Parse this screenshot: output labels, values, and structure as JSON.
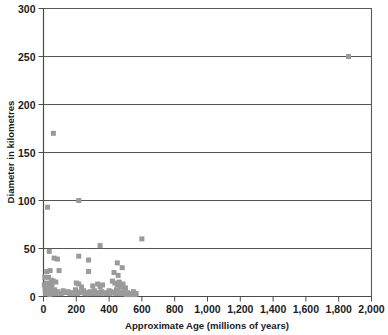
{
  "chart_data": {
    "type": "scatter",
    "title": "",
    "subtitle": "",
    "xlabel": "Approximate Age (millions of years)",
    "ylabel": "Diameter in kilometres",
    "xlim": [
      0,
      2000
    ],
    "ylim": [
      0,
      300
    ],
    "xticks": [
      0,
      200,
      400,
      600,
      800,
      1000,
      1200,
      1400,
      1600,
      1800,
      2000
    ],
    "xtick_labels": [
      "0",
      "200",
      "400",
      "600",
      "800",
      "1,000",
      "1,200",
      "1,400",
      "1,600",
      "1,800",
      "2,000"
    ],
    "yticks": [
      0,
      50,
      100,
      150,
      200,
      250,
      300
    ],
    "ytick_labels": [
      "0",
      "50",
      "100",
      "150",
      "200",
      "250",
      "300"
    ],
    "grid": "horizontal",
    "gridlines_y": [
      50,
      100,
      150,
      200,
      250
    ],
    "legend": "none",
    "marker": "square",
    "marker_color": "#9a9a9a",
    "marker_size_px": 5,
    "series": [
      {
        "name": "Impact craters",
        "points": [
          [
            1860,
            250
          ],
          [
            60,
            170
          ],
          [
            215,
            100
          ],
          [
            25,
            93
          ],
          [
            600,
            60
          ],
          [
            345,
            53
          ],
          [
            35,
            47
          ],
          [
            65,
            40
          ],
          [
            85,
            39
          ],
          [
            215,
            42
          ],
          [
            275,
            38
          ],
          [
            450,
            35
          ],
          [
            480,
            30
          ],
          [
            20,
            26
          ],
          [
            40,
            27
          ],
          [
            95,
            27
          ],
          [
            275,
            26
          ],
          [
            430,
            25
          ],
          [
            455,
            22
          ],
          [
            30,
            20
          ],
          [
            48,
            17
          ],
          [
            60,
            16
          ],
          [
            75,
            15
          ],
          [
            18,
            14
          ],
          [
            36,
            13
          ],
          [
            52,
            12
          ],
          [
            200,
            14
          ],
          [
            215,
            13
          ],
          [
            232,
            10
          ],
          [
            300,
            11
          ],
          [
            330,
            13
          ],
          [
            345,
            10
          ],
          [
            360,
            12
          ],
          [
            420,
            16
          ],
          [
            435,
            14
          ],
          [
            450,
            12
          ],
          [
            462,
            15
          ],
          [
            470,
            10
          ],
          [
            485,
            13
          ],
          [
            500,
            9
          ],
          [
            10,
            8
          ],
          [
            22,
            9
          ],
          [
            30,
            7
          ],
          [
            42,
            8
          ],
          [
            55,
            6
          ],
          [
            68,
            7
          ],
          [
            88,
            5
          ],
          [
            120,
            6
          ],
          [
            150,
            5
          ],
          [
            175,
            4
          ],
          [
            195,
            7
          ],
          [
            228,
            5
          ],
          [
            245,
            6
          ],
          [
            262,
            4
          ],
          [
            285,
            5
          ],
          [
            310,
            6
          ],
          [
            338,
            4
          ],
          [
            355,
            5
          ],
          [
            372,
            4
          ],
          [
            400,
            6
          ],
          [
            412,
            5
          ],
          [
            428,
            4
          ],
          [
            445,
            7
          ],
          [
            458,
            5
          ],
          [
            472,
            4
          ],
          [
            492,
            6
          ],
          [
            512,
            4
          ],
          [
            530,
            3
          ],
          [
            548,
            5
          ],
          [
            565,
            3
          ],
          [
            12,
            3
          ],
          [
            26,
            4
          ],
          [
            38,
            2
          ],
          [
            5,
            12
          ],
          [
            8,
            20
          ],
          [
            16,
            6
          ],
          [
            46,
            4
          ],
          [
            58,
            3
          ],
          [
            78,
            3
          ],
          [
            108,
            3
          ],
          [
            135,
            4
          ],
          [
            162,
            3
          ],
          [
            188,
            3
          ],
          [
            208,
            3
          ],
          [
            222,
            4
          ],
          [
            252,
            3
          ],
          [
            268,
            3
          ],
          [
            292,
            3
          ],
          [
            318,
            3
          ],
          [
            348,
            3
          ],
          [
            380,
            3
          ],
          [
            405,
            3
          ],
          [
            440,
            3
          ],
          [
            465,
            3
          ],
          [
            480,
            3
          ],
          [
            505,
            2
          ],
          [
            520,
            2
          ],
          [
            540,
            2
          ],
          [
            558,
            2
          ]
        ]
      }
    ]
  }
}
